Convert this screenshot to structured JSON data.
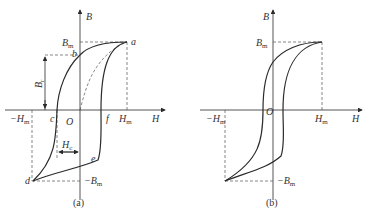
{
  "figure": {
    "panels": [
      {
        "id": "a",
        "caption": "(a)",
        "labels": {
          "B": "B",
          "H": "H",
          "O": "O",
          "Bm": "B",
          "Bm_sub": "m",
          "negBm": "−B",
          "negBm_sub": "m",
          "Hm": "H",
          "Hm_sub": "m",
          "negHm": "−H",
          "negHm_sub": "m",
          "Br": "B",
          "Br_sub": "r",
          "Hc": "H",
          "Hc_sub": "c",
          "points": {
            "a": "a",
            "b": "b",
            "c": "c",
            "d": "d",
            "e": "e",
            "f": "f"
          }
        }
      },
      {
        "id": "b",
        "caption": "(b)",
        "labels": {
          "B": "B",
          "H": "H",
          "O": "O",
          "Bm": "B",
          "Bm_sub": "m",
          "negBm": "−B",
          "negBm_sub": "m",
          "Hm": "H",
          "Hm_sub": "m",
          "negHm": "−H",
          "negHm_sub": "m"
        }
      }
    ],
    "colors": {
      "line": "#2a2a2a",
      "dashed": "#555555"
    }
  }
}
